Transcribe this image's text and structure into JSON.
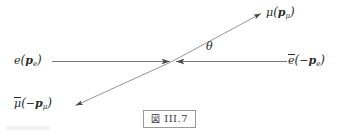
{
  "figure": {
    "caption": {
      "fig_marker": "図",
      "number": "III.7"
    },
    "background_color": "#ffffff",
    "line_color": "#555555",
    "text_color": "#2b2b2b"
  },
  "labels": {
    "electron_in": {
      "particle": "e",
      "open_paren": "(",
      "momentum": "p",
      "momentum_sub": "e",
      "close_paren": ")"
    },
    "positron_in": {
      "particle": "e",
      "open_paren": "(",
      "sign": "−",
      "momentum": "p",
      "momentum_sub": "e",
      "close_paren": ")"
    },
    "muon_out": {
      "particle": "μ",
      "open_paren": "(",
      "momentum": "p",
      "momentum_sub": "μ",
      "close_paren": ")"
    },
    "antimuon_out": {
      "particle": "μ",
      "open_paren": "(",
      "sign": "−",
      "momentum": "p",
      "momentum_sub": "μ",
      "close_paren": ")"
    },
    "angle": "θ"
  },
  "geometry": {
    "vertex": {
      "x": 172,
      "y": 61
    },
    "incoming_left_start": {
      "x": 52,
      "y": 61
    },
    "incoming_right_start": {
      "x": 287,
      "y": 61
    },
    "outgoing_upper_right_tip": {
      "x": 263,
      "y": 12
    },
    "outgoing_lower_left_tip": {
      "x": 73,
      "y": 107
    }
  }
}
